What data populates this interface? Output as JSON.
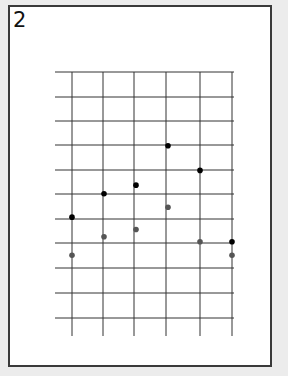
{
  "figure": {
    "label": "2"
  },
  "chart_data": {
    "type": "scatter",
    "title": "",
    "xlabel": "",
    "ylabel": "",
    "grid": true,
    "x_ticks": 6,
    "y_ticks": 11,
    "xlim": [
      0,
      5
    ],
    "ylim": [
      0,
      10
    ],
    "tick_labels_shown": false,
    "series": [
      {
        "name": "black points",
        "color": "#000000",
        "points": [
          {
            "x": 0,
            "y": 4.1
          },
          {
            "x": 1,
            "y": 5.05
          },
          {
            "x": 2,
            "y": 5.4
          },
          {
            "x": 3,
            "y": 7.0
          },
          {
            "x": 4,
            "y": 6.0
          },
          {
            "x": 5,
            "y": 3.1
          }
        ]
      },
      {
        "name": "gray points",
        "color": "#555555",
        "points": [
          {
            "x": 0,
            "y": 2.55
          },
          {
            "x": 1,
            "y": 3.3
          },
          {
            "x": 2,
            "y": 3.6
          },
          {
            "x": 3,
            "y": 4.5
          },
          {
            "x": 4,
            "y": 3.1
          },
          {
            "x": 5,
            "y": 2.55
          }
        ]
      }
    ]
  },
  "geometry": {
    "x_lines": [
      72,
      103,
      134,
      166,
      200,
      232
    ],
    "y_lines": [
      72,
      97,
      121,
      145,
      170,
      194,
      219,
      243,
      268,
      293,
      318
    ],
    "h_start": 55,
    "h_end": 234,
    "v_end": 336
  }
}
